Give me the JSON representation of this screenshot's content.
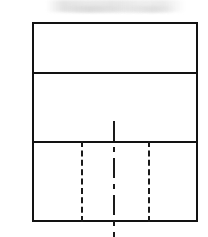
{
  "drawing": {
    "title": "Orthographic elevation sketch",
    "description": "Line drawing of a rectangular elevation divided into three horizontal bands, with two vertical hidden (dashed) lines and one vertical centerline in the lower band",
    "canvas": {
      "width": 208,
      "height": 237,
      "background": "#ffffff"
    },
    "colors": {
      "stroke": "#121212",
      "hidden_line": "#1a1a1a",
      "center_line": "#1a1a1a",
      "fill": "#ffffff",
      "smudge": "#d0d0d0"
    },
    "outer_rectangle": {
      "name": "outer-outline",
      "x": 32,
      "y": 22,
      "width": 166,
      "height": 200,
      "stroke_width": 2,
      "style": "solid"
    },
    "horizontal_dividers": [
      {
        "name": "divider-upper",
        "y": 72,
        "x1": 32,
        "x2": 198,
        "thickness": 2,
        "style": "solid"
      },
      {
        "name": "divider-lower",
        "y": 141,
        "x1": 32,
        "x2": 198,
        "thickness": 2,
        "style": "solid"
      }
    ],
    "vertical_lines": [
      {
        "name": "hidden-line-left",
        "x": 81,
        "y1": 141,
        "y2": 222,
        "thickness": 2,
        "style": "dashed",
        "dash": 7,
        "gap": 5
      },
      {
        "name": "hidden-line-right",
        "x": 148,
        "y1": 141,
        "y2": 222,
        "thickness": 2,
        "style": "dashed",
        "dash": 7,
        "gap": 5
      },
      {
        "name": "center-line",
        "x": 114,
        "y1": 121,
        "y2": 237,
        "thickness": 2,
        "style": "dash-dot",
        "long_dash": 20,
        "short_dash": 5,
        "gap": 6
      }
    ],
    "bands": [
      {
        "name": "band-top",
        "top": 22,
        "bottom": 72,
        "height": 50
      },
      {
        "name": "band-middle",
        "top": 72,
        "bottom": 141,
        "height": 69
      },
      {
        "name": "band-bottom",
        "top": 141,
        "bottom": 222,
        "height": 81
      }
    ],
    "artifacts": [
      {
        "name": "scan-smudge-top",
        "x": 46,
        "y": 0,
        "width": 140,
        "height": 12
      }
    ]
  }
}
